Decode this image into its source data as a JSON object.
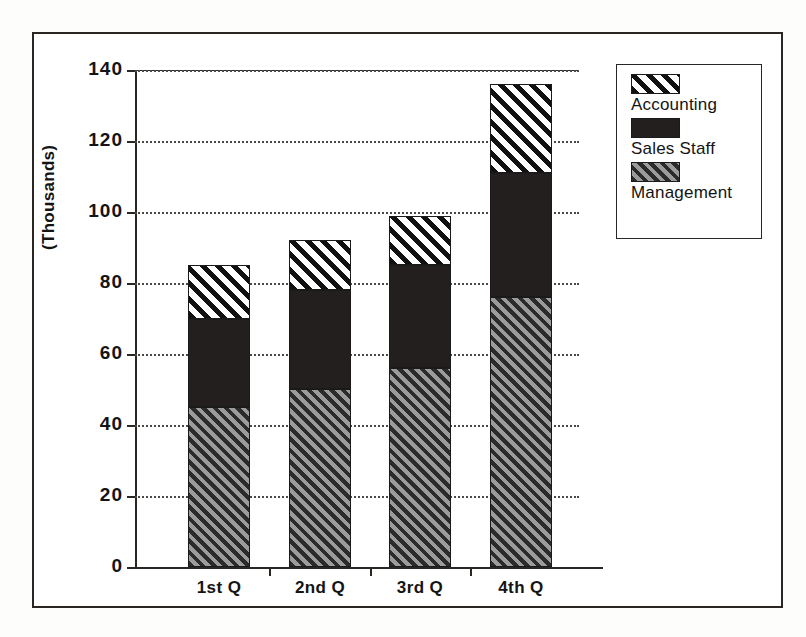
{
  "chart_data": {
    "type": "bar",
    "subtype": "stacked-bar",
    "title": "",
    "xlabel": "",
    "ylabel": "(Thousands)",
    "categories": [
      "1st Q",
      "2nd Q",
      "3rd Q",
      "4th Q"
    ],
    "series": [
      {
        "name": "Management",
        "values": [
          45,
          50,
          56,
          76
        ],
        "pattern": "grey-diagonal-hatch",
        "color": "#8d8d8d"
      },
      {
        "name": "Sales Staff",
        "values": [
          25,
          28,
          29,
          35
        ],
        "pattern": "solid-black",
        "color": "#231f1e"
      },
      {
        "name": "Accounting",
        "values": [
          15,
          14,
          14,
          25
        ],
        "pattern": "white-diagonal-hatch",
        "color": "#ffffff"
      }
    ],
    "stack_order_bottom_to_top": [
      "Management",
      "Sales Staff",
      "Accounting"
    ],
    "stack_totals": [
      85,
      92,
      99,
      136
    ],
    "cumulative_tops": [
      {
        "category": "1st Q",
        "management": 45,
        "sales_staff": 70,
        "accounting": 85
      },
      {
        "category": "2nd Q",
        "management": 50,
        "sales_staff": 78,
        "accounting": 92
      },
      {
        "category": "3rd Q",
        "management": 56,
        "sales_staff": 85,
        "accounting": 99
      },
      {
        "category": "4th Q",
        "management": 76,
        "sales_staff": 111,
        "accounting": 136
      }
    ],
    "ylim": [
      0,
      140
    ],
    "yticks": [
      0,
      20,
      40,
      60,
      80,
      100,
      120,
      140
    ],
    "ytick_labels": [
      "0",
      "20",
      "40",
      "60",
      "80",
      "100",
      "120",
      "140"
    ],
    "grid": true,
    "grid_style": "dotted-horizontal",
    "legend_position": "right-outside",
    "legend_entries": [
      "Accounting",
      "Sales Staff",
      "Management"
    ]
  },
  "axis": {
    "y_title": "(Thousands)"
  },
  "legend": {
    "items": [
      {
        "label": "Accounting",
        "swatch": "hatch-white-swatch"
      },
      {
        "label": "Sales Staff",
        "swatch": "solid-black-swatch"
      },
      {
        "label": "Management",
        "swatch": "hatch-grey-swatch"
      }
    ]
  }
}
